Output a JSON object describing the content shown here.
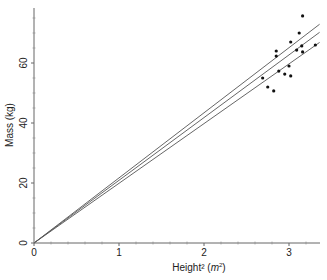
{
  "chart_data": {
    "type": "scatter",
    "title": "",
    "xlabel": "Height² (m²)",
    "xlabel_main": "Height² (",
    "xlabel_unit": "m",
    "xlabel_sup": "2",
    "xlabel_end": ")",
    "ylabel": "Mass (kg)",
    "xlim": [
      0,
      3.36
    ],
    "ylim": [
      0,
      78
    ],
    "xticks": [
      0,
      1,
      2,
      3
    ],
    "xtick_labels": [
      "0",
      "1",
      "2",
      "3"
    ],
    "yticks": [
      0,
      20,
      40,
      60
    ],
    "ytick_labels": [
      "0",
      "20",
      "40",
      "60"
    ],
    "grid": false,
    "legend": null,
    "points": [
      {
        "x": 3.16,
        "y": 75.7
      },
      {
        "x": 3.12,
        "y": 70.0
      },
      {
        "x": 3.02,
        "y": 67.0
      },
      {
        "x": 2.85,
        "y": 64.0
      },
      {
        "x": 2.85,
        "y": 62.3
      },
      {
        "x": 3.15,
        "y": 65.7
      },
      {
        "x": 3.09,
        "y": 64.3
      },
      {
        "x": 3.16,
        "y": 63.7
      },
      {
        "x": 3.31,
        "y": 66.0
      },
      {
        "x": 3.0,
        "y": 59.0
      },
      {
        "x": 2.88,
        "y": 57.3
      },
      {
        "x": 2.95,
        "y": 56.3
      },
      {
        "x": 3.02,
        "y": 55.7
      },
      {
        "x": 2.69,
        "y": 55.0
      },
      {
        "x": 2.75,
        "y": 52.0
      },
      {
        "x": 2.82,
        "y": 50.7
      }
    ],
    "lines": [
      {
        "name": "upper",
        "slope": 21.7,
        "x_end": 3.36
      },
      {
        "name": "fit",
        "slope": 20.9,
        "x_end": 3.36
      },
      {
        "name": "lower",
        "slope": 19.9,
        "x_end": 3.36
      }
    ],
    "colors": {
      "axis": "#666666",
      "points": "#111111",
      "lines": "#555555"
    }
  }
}
